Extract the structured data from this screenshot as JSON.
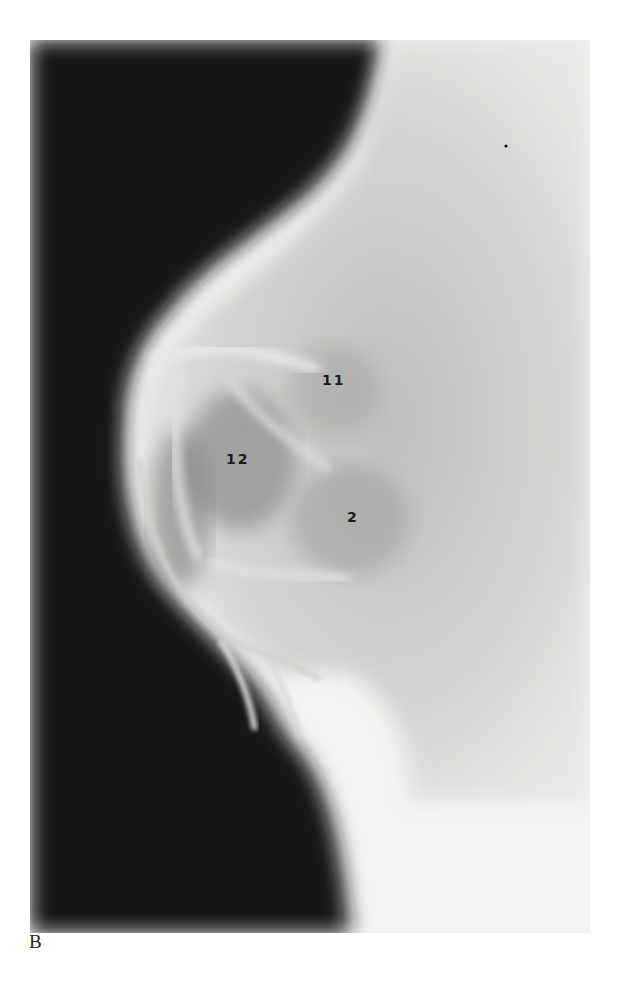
{
  "figure": {
    "panel_letter": "B",
    "colors": {
      "dark": "#141414",
      "light": "#f4f4f2",
      "mid": "#9a9a9a"
    },
    "labels": [
      {
        "text": "11",
        "x": 322,
        "y": 372
      },
      {
        "text": "12",
        "x": 226,
        "y": 451
      },
      {
        "text": "2",
        "x": 347,
        "y": 509
      }
    ]
  }
}
